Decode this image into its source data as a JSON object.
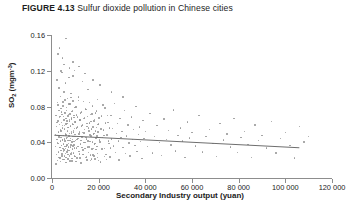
{
  "figure": {
    "number_label": "FIGURE 4.13",
    "caption": "Sulfur dioxide pollution in Chinese cities"
  },
  "chart_data": {
    "type": "scatter",
    "title": "Sulfur dioxide pollution in Chinese cities",
    "xlabel": "Secondary Industry output (yuan)",
    "ylabel": "SO2 (mgm-3)",
    "ylabel_base": "SO",
    "ylabel_sub": "2",
    "ylabel_unit": "(mgm",
    "ylabel_sup": "-3",
    "ylabel_unit_close": ")",
    "xlim": [
      0,
      120000
    ],
    "ylim": [
      0.0,
      0.16
    ],
    "xticks": [
      0,
      20000,
      40000,
      60000,
      80000,
      100000,
      120000
    ],
    "xticklabels": [
      "0",
      "20 000",
      "40 000",
      "60 000",
      "80 000",
      "100 000",
      "120 000"
    ],
    "yticks": [
      0.0,
      0.04,
      0.08,
      0.12,
      0.16
    ],
    "yticklabels": [
      "0.00",
      "0.04",
      "0.08",
      "0.12",
      "0.16"
    ],
    "grid": false,
    "legend": null,
    "marker_color": "#9a9a9a",
    "axis_color": "#8d8d8d",
    "fit_line": {
      "label": "linear regression",
      "color": "#6e6e6e",
      "x_start": 1000,
      "y_start": 0.0478,
      "x_end": 106000,
      "y_end": 0.0338
    },
    "n_points": 396,
    "points": [
      [
        1800,
        0.0155
      ],
      [
        2100,
        0.062
      ],
      [
        2300,
        0.0398
      ],
      [
        2500,
        0.0815
      ],
      [
        2700,
        0.0292
      ],
      [
        2900,
        0.1005
      ],
      [
        3000,
        0.0455
      ],
      [
        3100,
        0.0228
      ],
      [
        3300,
        0.0678
      ],
      [
        3400,
        0.034
      ],
      [
        3600,
        0.0912
      ],
      [
        3700,
        0.0185
      ],
      [
        3800,
        0.0525
      ],
      [
        4000,
        0.074
      ],
      [
        4100,
        0.0365
      ],
      [
        4200,
        0.118
      ],
      [
        4300,
        0.0268
      ],
      [
        4400,
        0.0588
      ],
      [
        4600,
        0.0432
      ],
      [
        4700,
        0.085
      ],
      [
        4800,
        0.0205
      ],
      [
        4900,
        0.069
      ],
      [
        5000,
        0.0378
      ],
      [
        5100,
        0.0315
      ],
      [
        5200,
        0.0962
      ],
      [
        5300,
        0.0548
      ],
      [
        5400,
        0.0248
      ],
      [
        5500,
        0.0725
      ],
      [
        5600,
        0.0415
      ],
      [
        5700,
        0.1062
      ],
      [
        5800,
        0.0332
      ],
      [
        5900,
        0.0605
      ],
      [
        6000,
        0.0172
      ],
      [
        6100,
        0.048
      ],
      [
        6200,
        0.0788
      ],
      [
        6300,
        0.0358
      ],
      [
        6400,
        0.064
      ],
      [
        6500,
        0.029
      ],
      [
        6600,
        0.0892
      ],
      [
        6700,
        0.0452
      ],
      [
        6800,
        0.0212
      ],
      [
        6900,
        0.0565
      ],
      [
        7000,
        0.071
      ],
      [
        7100,
        0.0388
      ],
      [
        7200,
        0.1125
      ],
      [
        7300,
        0.0305
      ],
      [
        7400,
        0.0498
      ],
      [
        7500,
        0.0655
      ],
      [
        7600,
        0.0238
      ],
      [
        7700,
        0.0828
      ],
      [
        7800,
        0.0422
      ],
      [
        7900,
        0.0582
      ],
      [
        8000,
        0.0348
      ],
      [
        8100,
        0.0945
      ],
      [
        8200,
        0.0268
      ],
      [
        8300,
        0.0518
      ],
      [
        8400,
        0.0672
      ],
      [
        8500,
        0.0402
      ],
      [
        8600,
        0.0188
      ],
      [
        8700,
        0.0755
      ],
      [
        8800,
        0.0325
      ],
      [
        8900,
        0.0598
      ],
      [
        9000,
        0.0465
      ],
      [
        9100,
        0.0862
      ],
      [
        9200,
        0.0282
      ],
      [
        9300,
        0.0532
      ],
      [
        9400,
        0.0702
      ],
      [
        9500,
        0.0372
      ],
      [
        9600,
        0.1205
      ],
      [
        9700,
        0.0248
      ],
      [
        9800,
        0.0488
      ],
      [
        9900,
        0.0628
      ],
      [
        10000,
        0.0418
      ],
      [
        10200,
        0.0795
      ],
      [
        10400,
        0.0335
      ],
      [
        10600,
        0.0562
      ],
      [
        10800,
        0.0222
      ],
      [
        11000,
        0.0685
      ],
      [
        11200,
        0.0442
      ],
      [
        11400,
        0.0908
      ],
      [
        11600,
        0.0298
      ],
      [
        11800,
        0.0515
      ],
      [
        12000,
        0.0648
      ],
      [
        12200,
        0.0382
      ],
      [
        12400,
        0.0168
      ],
      [
        12600,
        0.0738
      ],
      [
        12800,
        0.0458
      ],
      [
        13000,
        0.0592
      ],
      [
        13200,
        0.0312
      ],
      [
        13400,
        0.0855
      ],
      [
        13600,
        0.0262
      ],
      [
        13800,
        0.0505
      ],
      [
        14000,
        0.0672
      ],
      [
        14200,
        0.0395
      ],
      [
        14400,
        0.0228
      ],
      [
        14600,
        0.0768
      ],
      [
        14800,
        0.0435
      ],
      [
        15000,
        0.0575
      ],
      [
        15200,
        0.0345
      ],
      [
        15400,
        0.0988
      ],
      [
        15600,
        0.0285
      ],
      [
        15800,
        0.0528
      ],
      [
        16000,
        0.0618
      ],
      [
        16200,
        0.0408
      ],
      [
        16400,
        0.0195
      ],
      [
        16600,
        0.0712
      ],
      [
        16800,
        0.0468
      ],
      [
        17000,
        0.0548
      ],
      [
        17200,
        0.0322
      ],
      [
        17400,
        0.0805
      ],
      [
        17600,
        0.0255
      ],
      [
        17800,
        0.0492
      ],
      [
        18000,
        0.0635
      ],
      [
        18200,
        0.0378
      ],
      [
        18400,
        0.0212
      ],
      [
        18600,
        0.0725
      ],
      [
        18800,
        0.0445
      ],
      [
        19000,
        0.0565
      ],
      [
        19200,
        0.0352
      ],
      [
        19400,
        0.0878
      ],
      [
        19600,
        0.0275
      ],
      [
        19800,
        0.0512
      ],
      [
        20000,
        0.0602
      ],
      [
        20400,
        0.0425
      ],
      [
        20800,
        0.0178
      ],
      [
        21200,
        0.0695
      ],
      [
        21600,
        0.0455
      ],
      [
        22000,
        0.0538
      ],
      [
        22400,
        0.0332
      ],
      [
        22800,
        0.0782
      ],
      [
        23200,
        0.0265
      ],
      [
        23600,
        0.0482
      ],
      [
        24000,
        0.0622
      ],
      [
        24400,
        0.0388
      ],
      [
        24800,
        0.0235
      ],
      [
        25200,
        0.0702
      ],
      [
        25600,
        0.0438
      ],
      [
        26000,
        0.0555
      ],
      [
        26400,
        0.0358
      ],
      [
        26800,
        0.0835
      ],
      [
        27200,
        0.0288
      ],
      [
        27600,
        0.0498
      ],
      [
        28000,
        0.0608
      ],
      [
        28400,
        0.0415
      ],
      [
        28800,
        0.0202
      ],
      [
        29200,
        0.0668
      ],
      [
        29600,
        0.0452
      ],
      [
        30000,
        0.0522
      ],
      [
        30500,
        0.0342
      ],
      [
        31000,
        0.0755
      ],
      [
        31500,
        0.0272
      ],
      [
        32000,
        0.0472
      ],
      [
        32500,
        0.0595
      ],
      [
        33000,
        0.0392
      ],
      [
        33500,
        0.0245
      ],
      [
        34000,
        0.0682
      ],
      [
        34500,
        0.0428
      ],
      [
        35000,
        0.0542
      ],
      [
        35500,
        0.0365
      ],
      [
        36000,
        0.0798
      ],
      [
        36500,
        0.0295
      ],
      [
        37000,
        0.0488
      ],
      [
        37500,
        0.0572
      ],
      [
        38000,
        0.0408
      ],
      [
        38500,
        0.0218
      ],
      [
        39000,
        0.0645
      ],
      [
        39500,
        0.0442
      ],
      [
        40000,
        0.0518
      ],
      [
        41000,
        0.0352
      ],
      [
        42000,
        0.0722
      ],
      [
        43000,
        0.0282
      ],
      [
        44000,
        0.0465
      ],
      [
        45000,
        0.0585
      ],
      [
        46000,
        0.0398
      ],
      [
        47000,
        0.0252
      ],
      [
        48000,
        0.0658
      ],
      [
        49000,
        0.0432
      ],
      [
        50000,
        0.0532
      ],
      [
        51000,
        0.0372
      ],
      [
        52000,
        0.0762
      ],
      [
        53000,
        0.0302
      ],
      [
        54000,
        0.0478
      ],
      [
        55000,
        0.0558
      ],
      [
        56000,
        0.0412
      ],
      [
        57000,
        0.0228
      ],
      [
        58000,
        0.0625
      ],
      [
        59000,
        0.0448
      ],
      [
        60000,
        0.0508
      ],
      [
        61500,
        0.0358
      ],
      [
        63000,
        0.0698
      ],
      [
        64500,
        0.0292
      ],
      [
        66000,
        0.0462
      ],
      [
        67500,
        0.0545
      ],
      [
        69000,
        0.0385
      ],
      [
        70500,
        0.0242
      ],
      [
        72000,
        0.0612
      ],
      [
        73500,
        0.0425
      ],
      [
        75000,
        0.0492
      ],
      [
        76500,
        0.0348
      ],
      [
        78000,
        0.0665
      ],
      [
        79500,
        0.0288
      ],
      [
        81000,
        0.0452
      ],
      [
        82500,
        0.0522
      ],
      [
        84000,
        0.0375
      ],
      [
        85500,
        0.0232
      ],
      [
        87000,
        0.0592
      ],
      [
        88500,
        0.0418
      ],
      [
        90000,
        0.0478
      ],
      [
        92000,
        0.0338
      ],
      [
        94000,
        0.0632
      ],
      [
        96000,
        0.0278
      ],
      [
        98000,
        0.0442
      ],
      [
        100000,
        0.0508
      ],
      [
        102000,
        0.0362
      ],
      [
        104000,
        0.0222
      ],
      [
        106000,
        0.0575
      ],
      [
        108000,
        0.0402
      ],
      [
        110000,
        0.0462
      ],
      [
        3200,
        0.1452
      ],
      [
        6050,
        0.1562
      ],
      [
        9050,
        0.1298
      ],
      [
        4550,
        0.1342
      ],
      [
        11500,
        0.1248
      ],
      [
        14200,
        0.1168
      ],
      [
        17500,
        0.1095
      ],
      [
        2600,
        0.1388
      ],
      [
        7600,
        0.1228
      ],
      [
        20500,
        0.1042
      ],
      [
        5050,
        0.1268
      ],
      [
        25500,
        0.0962
      ],
      [
        3900,
        0.1195
      ],
      [
        8900,
        0.1142
      ],
      [
        13000,
        0.1078
      ],
      [
        30500,
        0.0905
      ],
      [
        2200,
        0.1098
      ],
      [
        1500,
        0.0485
      ],
      [
        1600,
        0.0355
      ],
      [
        1700,
        0.0702
      ],
      [
        1900,
        0.0265
      ],
      [
        2000,
        0.0575
      ],
      [
        2150,
        0.0432
      ],
      [
        2350,
        0.0845
      ],
      [
        2450,
        0.0198
      ],
      [
        2550,
        0.0638
      ],
      [
        2650,
        0.0385
      ],
      [
        2750,
        0.0515
      ],
      [
        2850,
        0.0288
      ],
      [
        2950,
        0.0755
      ],
      [
        3050,
        0.0465
      ],
      [
        3150,
        0.0342
      ],
      [
        3250,
        0.0598
      ],
      [
        3350,
        0.0222
      ],
      [
        3450,
        0.0688
      ],
      [
        3550,
        0.0412
      ],
      [
        3650,
        0.0535
      ],
      [
        3750,
        0.0308
      ],
      [
        3850,
        0.0778
      ],
      [
        3950,
        0.0452
      ],
      [
        4050,
        0.0362
      ],
      [
        4150,
        0.0622
      ],
      [
        4250,
        0.0245
      ],
      [
        4350,
        0.0712
      ],
      [
        4450,
        0.0425
      ],
      [
        4550,
        0.0558
      ],
      [
        4650,
        0.0332
      ],
      [
        4750,
        0.0805
      ],
      [
        4850,
        0.0478
      ],
      [
        4950,
        0.0298
      ],
      [
        5050,
        0.0648
      ],
      [
        5150,
        0.0208
      ],
      [
        5250,
        0.0735
      ],
      [
        5350,
        0.0438
      ],
      [
        5450,
        0.0588
      ],
      [
        5550,
        0.0355
      ],
      [
        5650,
        0.0872
      ],
      [
        5750,
        0.0492
      ],
      [
        5850,
        0.0275
      ],
      [
        5950,
        0.0668
      ],
      [
        6050,
        0.0232
      ],
      [
        6150,
        0.0758
      ],
      [
        6250,
        0.0448
      ],
      [
        6350,
        0.0612
      ],
      [
        6450,
        0.0372
      ],
      [
        6550,
        0.0315
      ],
      [
        6650,
        0.0525
      ],
      [
        6750,
        0.0262
      ],
      [
        6850,
        0.0692
      ],
      [
        6950,
        0.0418
      ],
      [
        7050,
        0.0565
      ],
      [
        7150,
        0.0345
      ],
      [
        7250,
        0.0828
      ],
      [
        7350,
        0.0472
      ],
      [
        7450,
        0.0252
      ],
      [
        7550,
        0.0635
      ],
      [
        7650,
        0.0192
      ],
      [
        7750,
        0.0718
      ],
      [
        7850,
        0.0442
      ],
      [
        7950,
        0.0578
      ],
      [
        8050,
        0.0368
      ],
      [
        8150,
        0.0902
      ],
      [
        8250,
        0.0502
      ],
      [
        8350,
        0.0285
      ],
      [
        8450,
        0.0658
      ],
      [
        8550,
        0.0218
      ],
      [
        8650,
        0.0742
      ],
      [
        8750,
        0.0432
      ],
      [
        8850,
        0.0605
      ],
      [
        8950,
        0.0358
      ],
      [
        9150,
        0.0515
      ],
      [
        9250,
        0.0272
      ],
      [
        9350,
        0.0678
      ],
      [
        9450,
        0.0408
      ],
      [
        9550,
        0.0552
      ],
      [
        9650,
        0.0338
      ],
      [
        9750,
        0.0788
      ],
      [
        9850,
        0.0462
      ],
      [
        9950,
        0.0242
      ],
      [
        10100,
        0.0625
      ],
      [
        10300,
        0.0185
      ],
      [
        10500,
        0.0705
      ],
      [
        10700,
        0.0428
      ],
      [
        10900,
        0.0568
      ],
      [
        11100,
        0.0352
      ],
      [
        11300,
        0.0865
      ],
      [
        11500,
        0.0495
      ],
      [
        11700,
        0.0268
      ],
      [
        11900,
        0.0648
      ],
      [
        12100,
        0.0225
      ],
      [
        12300,
        0.0728
      ],
      [
        12500,
        0.0418
      ],
      [
        12700,
        0.0582
      ],
      [
        12900,
        0.0342
      ],
      [
        13100,
        0.0508
      ],
      [
        13300,
        0.0262
      ],
      [
        13500,
        0.0665
      ],
      [
        13700,
        0.0398
      ],
      [
        13900,
        0.0542
      ],
      [
        14100,
        0.0328
      ],
      [
        14300,
        0.0772
      ],
      [
        14500,
        0.0452
      ],
      [
        14700,
        0.0235
      ],
      [
        14900,
        0.0612
      ],
      [
        15100,
        0.0202
      ],
      [
        15300,
        0.0688
      ],
      [
        15500,
        0.0415
      ],
      [
        15700,
        0.0558
      ],
      [
        15900,
        0.0348
      ],
      [
        16100,
        0.0845
      ],
      [
        16300,
        0.0482
      ],
      [
        16500,
        0.0255
      ],
      [
        16700,
        0.0632
      ],
      [
        16900,
        0.0212
      ],
      [
        17100,
        0.0715
      ],
      [
        17300,
        0.0405
      ],
      [
        17500,
        0.0572
      ],
      [
        17700,
        0.0332
      ],
      [
        17900,
        0.0498
      ],
      [
        18100,
        0.0248
      ],
      [
        18300,
        0.0652
      ],
      [
        18500,
        0.0388
      ],
      [
        18700,
        0.0528
      ],
      [
        18900,
        0.0318
      ],
      [
        19100,
        0.0748
      ],
      [
        19300,
        0.0468
      ],
      [
        19500,
        0.0228
      ],
      [
        19700,
        0.0598
      ],
      [
        19900,
        0.0195
      ],
      [
        20200,
        0.0672
      ],
      [
        20600,
        0.0402
      ],
      [
        21000,
        0.0548
      ],
      [
        21400,
        0.0325
      ],
      [
        21800,
        0.0818
      ],
      [
        22200,
        0.0475
      ],
      [
        22600,
        0.0242
      ],
      [
        23000,
        0.0618
      ],
      [
        23400,
        0.0205
      ],
      [
        23800,
        0.0698
      ],
      [
        24200,
        0.0412
      ],
      [
        24600,
        0.0562
      ],
      [
        25000,
        0.0338
      ]
    ]
  }
}
